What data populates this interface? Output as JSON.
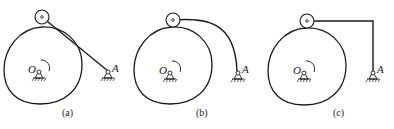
{
  "figure": {
    "panels": [
      {
        "id": "a",
        "caption": "(a)",
        "follower_type": "straight link",
        "labels": {
          "center": "O",
          "pivot": "A"
        }
      },
      {
        "id": "b",
        "caption": "(b)",
        "follower_type": "curved link",
        "labels": {
          "center": "O",
          "pivot": "A"
        }
      },
      {
        "id": "c",
        "caption": "(c)",
        "follower_type": "L-shaped link",
        "labels": {
          "center": "O",
          "pivot": "A"
        }
      }
    ],
    "colors": {
      "stroke": "#1a1a1a",
      "background": "#ffffff"
    }
  }
}
